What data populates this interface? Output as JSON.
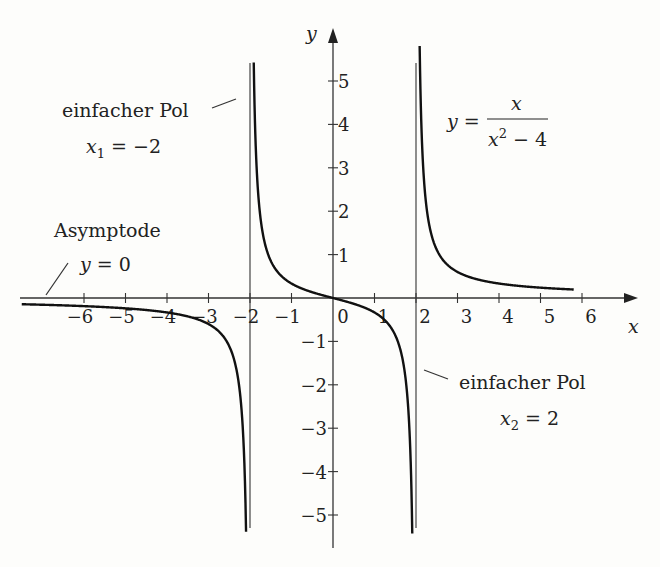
{
  "chart_data": {
    "type": "line",
    "title": "",
    "function": "y = x / (x^2 - 4)",
    "xlabel": "x",
    "ylabel": "y",
    "xlim": [
      -7.5,
      7
    ],
    "ylim": [
      -5.5,
      5.8
    ],
    "x_ticks": [
      -6,
      -5,
      -4,
      -3,
      -2,
      -1,
      0,
      1,
      2,
      3,
      4,
      5,
      6
    ],
    "y_ticks": [
      -5,
      -4,
      -3,
      -2,
      -1,
      1,
      2,
      3,
      4,
      5
    ],
    "grid": false,
    "vertical_asymptotes": [
      -2,
      2
    ],
    "horizontal_asymptote": 0,
    "series": [
      {
        "name": "y = x/(x^2-4), x < -2",
        "x": [
          -7.5,
          -6,
          -5,
          -4,
          -3,
          -2.5,
          -2.2,
          -2.1
        ],
        "y": [
          -0.144,
          -0.188,
          -0.238,
          -0.333,
          -0.6,
          -1.111,
          -2.619,
          -5.12
        ]
      },
      {
        "name": "y = x/(x^2-4), -2 < x < 2",
        "x": [
          -1.91,
          -1.8,
          -1.5,
          -1,
          0,
          1,
          1.5,
          1.8,
          1.91
        ],
        "y": [
          5.4,
          2.37,
          0.857,
          0.333,
          0,
          -0.333,
          -0.857,
          -2.37,
          -5.4
        ]
      },
      {
        "name": "y = x/(x^2-4), x > 2",
        "x": [
          2.09,
          2.2,
          2.5,
          3,
          4,
          5,
          5.8
        ],
        "y": [
          5.4,
          2.619,
          1.111,
          0.6,
          0.333,
          0.238,
          0.196
        ]
      }
    ],
    "annotations": [
      {
        "text": "einfacher Pol",
        "sub": "x1 = -2"
      },
      {
        "text": "einfacher Pol",
        "sub": "x2 = 2"
      },
      {
        "text": "Asymptode",
        "sub": "y = 0"
      },
      {
        "text": "y = x / (x^2 - 4)"
      }
    ]
  },
  "labels": {
    "x_axis": "x",
    "y_axis": "y",
    "pole1_title": "einfacher Pol",
    "pole1_var": "x",
    "pole1_sub": "1",
    "pole1_eq": " = −2",
    "pole2_title": "einfacher Pol",
    "pole2_var": "x",
    "pole2_sub": "2",
    "pole2_eq": " = 2",
    "asym_title": "Asymptode",
    "asym_eq_var": "y",
    "asym_eq": " = 0",
    "formula_lhs": "y",
    "formula_eq": " = ",
    "formula_num": "x",
    "formula_den_var": "x",
    "formula_den_exp": "2",
    "formula_den_rest": " − 4"
  },
  "ticks": {
    "x": [
      "−6",
      "−5",
      "−4",
      "−3",
      "−2",
      "−1",
      "0",
      "1",
      "2",
      "3",
      "4",
      "5",
      "6"
    ],
    "y": [
      "5",
      "4",
      "3",
      "2",
      "1",
      "−1",
      "−2",
      "−3",
      "−4",
      "−5"
    ]
  }
}
